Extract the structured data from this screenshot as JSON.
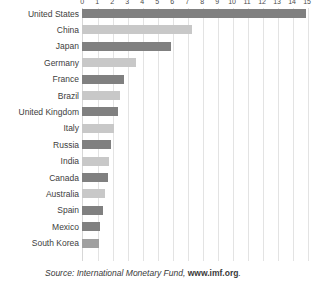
{
  "chart_data": {
    "type": "bar",
    "orientation": "horizontal",
    "title": "",
    "subtitle": "",
    "xlabel": "",
    "ylabel": "",
    "xlim": [
      0,
      15
    ],
    "grid": true,
    "legend": false,
    "axis_position": "top",
    "tick_labels": [
      "0",
      "1",
      "2",
      "3",
      "4",
      "5",
      "6",
      "7",
      "8",
      "9",
      "10",
      "11",
      "12",
      "13",
      "14",
      "15"
    ],
    "tick_values": [
      0,
      1,
      2,
      3,
      4,
      5,
      6,
      7,
      8,
      9,
      10,
      11,
      12,
      13,
      14,
      15
    ],
    "categories": [
      "United States",
      "China",
      "Japan",
      "Germany",
      "France",
      "Brazil",
      "United Kingdom",
      "Italy",
      "Russia",
      "India",
      "Canada",
      "Australia",
      "Spain",
      "Mexico",
      "South Korea"
    ],
    "values": [
      14.9,
      7.3,
      5.9,
      3.6,
      2.8,
      2.5,
      2.4,
      2.1,
      1.9,
      1.8,
      1.7,
      1.5,
      1.4,
      1.2,
      1.1
    ],
    "bar_colors": [
      "#808080",
      "#c8c8c8",
      "#808080",
      "#c8c8c8",
      "#808080",
      "#c8c8c8",
      "#808080",
      "#c8c8c8",
      "#808080",
      "#c8c8c8",
      "#808080",
      "#c8c8c8",
      "#808080",
      "#808080",
      "#a0a0a0"
    ]
  },
  "source": {
    "prefix": "Source: International Monetary Fund, ",
    "url": "www.imf.org",
    "suffix": "."
  },
  "colors": {
    "bar_dark": "#808080",
    "bar_light": "#c8c8c8",
    "gridline": "#e3e3e3",
    "text": "#3a3a3a",
    "background": "#ffffff"
  }
}
